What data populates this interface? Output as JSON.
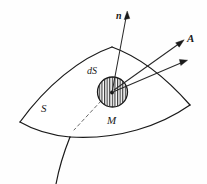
{
  "figure": {
    "kind": "surface-flux-diagram",
    "background_color": "#fefefe",
    "stroke_color": "#1a1a1a",
    "hatch_color": "#333333",
    "labels": {
      "normal_vector": "n",
      "field_vector": "A",
      "area_element": "dS",
      "surface": "S",
      "point": "M"
    },
    "elements": {
      "surface_patch": "curved quadrilateral surface patch",
      "area_element_circle": "hatched circle (vertical hatching)",
      "normal_arrow": "arrow from M pointing up",
      "field_arrow": "arrow from M pointing up-right labelled A",
      "secondary_arrow": "arrow from M pointing right",
      "dashed_leader": "dashed line from dS element toward lower-left",
      "coordinate_curve": "curve crossing the lower edge of the patch"
    }
  }
}
